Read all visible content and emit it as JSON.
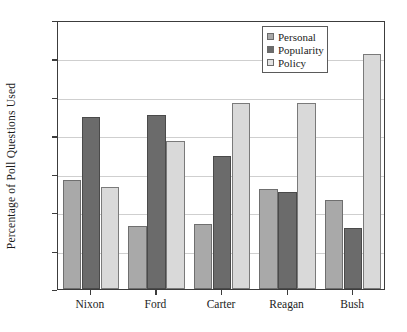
{
  "chart_data": {
    "type": "bar",
    "title": "",
    "xlabel": "",
    "ylabel": "Percentage of Poll Questions Used",
    "ylim": [
      0,
      70
    ],
    "yticks": [
      0,
      10,
      20,
      30,
      40,
      50,
      60,
      70
    ],
    "ytick_labels": [
      "0",
      "10",
      "20",
      "30",
      "40",
      "50",
      "60",
      "70"
    ],
    "grid": "horizontal",
    "legend_position": "top-right-inside",
    "categories": [
      "Nixon",
      "Ford",
      "Carter",
      "Reagan",
      "Bush"
    ],
    "series": [
      {
        "name": "Personal",
        "color": "#a9a9a9",
        "values": [
          28.4,
          16.4,
          16.8,
          26.1,
          23.1
        ]
      },
      {
        "name": "Popularity",
        "color": "#6b6b6b",
        "values": [
          44.7,
          45.2,
          34.5,
          25.2,
          15.9
        ]
      },
      {
        "name": "Policy",
        "color": "#d9d9d9",
        "values": [
          26.6,
          38.4,
          48.4,
          48.5,
          61.1
        ]
      }
    ]
  },
  "legend": {
    "items": [
      {
        "label": "Personal"
      },
      {
        "label": "Popularity"
      },
      {
        "label": "Policy"
      }
    ]
  }
}
